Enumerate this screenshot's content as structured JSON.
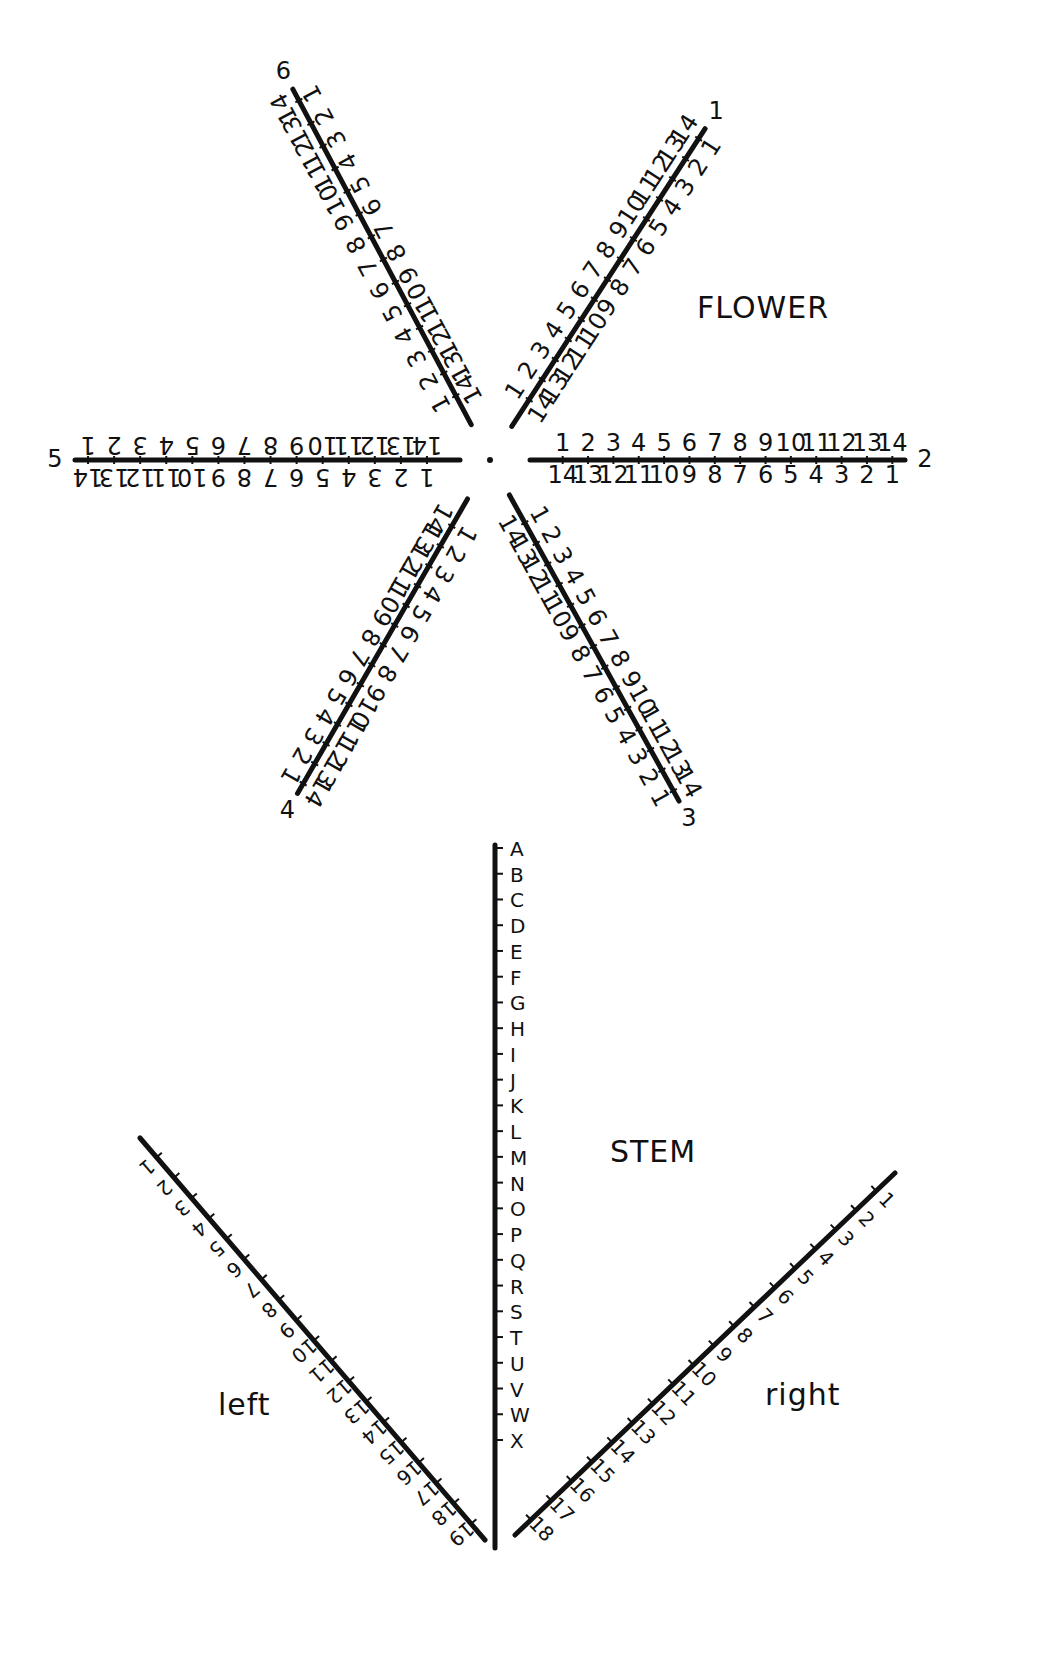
{
  "labels": {
    "flower": "FLOWER",
    "stem": "STEM",
    "left": "left",
    "right": "right"
  },
  "arms": [
    {
      "id": "1",
      "number_label": "1",
      "angle_deg": -57,
      "outer": [
        "1",
        "2",
        "3",
        "4",
        "5",
        "6",
        "7",
        "8",
        "9",
        "10",
        "11",
        "12",
        "13",
        "14"
      ],
      "inner": [
        "14",
        "13",
        "12",
        "11",
        "10",
        "9",
        "8",
        "7",
        "6",
        "5",
        "4",
        "3",
        "2",
        "1"
      ]
    },
    {
      "id": "2",
      "number_label": "2",
      "angle_deg": 0,
      "outer": [
        "1",
        "2",
        "3",
        "4",
        "5",
        "6",
        "7",
        "8",
        "9",
        "10",
        "11",
        "12",
        "13",
        "14"
      ],
      "inner": [
        "14",
        "13",
        "12",
        "11",
        "10",
        "9",
        "8",
        "7",
        "6",
        "5",
        "4",
        "3",
        "2",
        "1"
      ]
    },
    {
      "id": "3",
      "number_label": "3",
      "angle_deg": 61,
      "outer": [
        "1",
        "2",
        "3",
        "4",
        "5",
        "6",
        "7",
        "8",
        "9",
        "10",
        "11",
        "12",
        "13",
        "14"
      ],
      "inner": [
        "14",
        "13",
        "12",
        "11",
        "10",
        "9",
        "8",
        "7",
        "6",
        "5",
        "4",
        "3",
        "2",
        "1"
      ]
    },
    {
      "id": "4",
      "number_label": "4",
      "angle_deg": 120,
      "outer": [
        "1",
        "2",
        "3",
        "4",
        "5",
        "6",
        "7",
        "8",
        "9",
        "10",
        "11",
        "12",
        "13",
        "14"
      ],
      "inner": [
        "14",
        "13",
        "12",
        "11",
        "10",
        "9",
        "8",
        "7",
        "6",
        "5",
        "4",
        "3",
        "2",
        "1"
      ]
    },
    {
      "id": "5",
      "number_label": "5",
      "angle_deg": 180,
      "outer": [
        "1",
        "2",
        "3",
        "4",
        "5",
        "6",
        "7",
        "8",
        "9",
        "10",
        "11",
        "12",
        "13",
        "14"
      ],
      "inner": [
        "14",
        "13",
        "12",
        "11",
        "10",
        "9",
        "8",
        "7",
        "6",
        "5",
        "4",
        "3",
        "2",
        "1"
      ]
    },
    {
      "id": "6",
      "number_label": "6",
      "angle_deg": -118,
      "outer": [
        "1",
        "2",
        "3",
        "4",
        "5",
        "6",
        "7",
        "8",
        "9",
        "10",
        "11",
        "12",
        "13",
        "14"
      ],
      "inner": [
        "14",
        "13",
        "12",
        "11",
        "10",
        "9",
        "8",
        "7",
        "6",
        "5",
        "4",
        "3",
        "2",
        "1"
      ]
    }
  ],
  "stem": {
    "letters": [
      "A",
      "B",
      "C",
      "D",
      "E",
      "F",
      "G",
      "H",
      "I",
      "J",
      "K",
      "L",
      "M",
      "N",
      "O",
      "P",
      "Q",
      "R",
      "S",
      "T",
      "U",
      "V",
      "W",
      "X"
    ]
  },
  "leaves": {
    "left": [
      "1",
      "2",
      "3",
      "4",
      "5",
      "6",
      "7",
      "8",
      "9",
      "10",
      "11",
      "12",
      "13",
      "14",
      "15",
      "16",
      "17",
      "18",
      "19"
    ],
    "right": [
      "1",
      "2",
      "3",
      "4",
      "5",
      "6",
      "7",
      "8",
      "9",
      "10",
      "11",
      "12",
      "13",
      "14",
      "15",
      "16",
      "17",
      "18"
    ]
  }
}
